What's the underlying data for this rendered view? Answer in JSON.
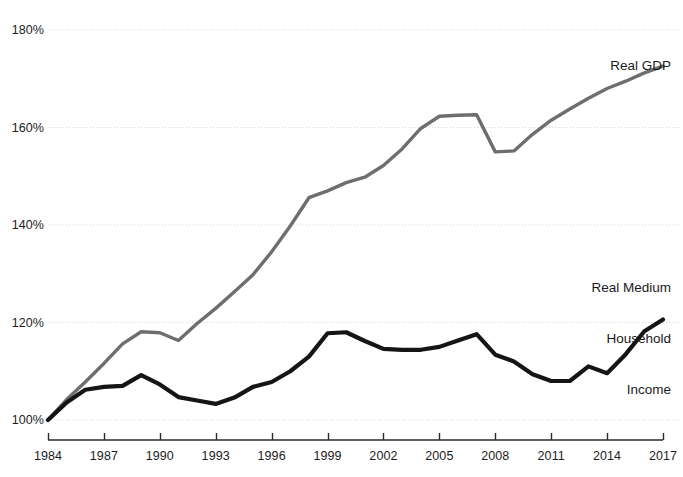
{
  "chart_data": {
    "type": "line",
    "title": "",
    "subtitle": "",
    "xlabel": "",
    "ylabel": "",
    "xlim": [
      1984,
      2017
    ],
    "ylim": [
      100,
      180
    ],
    "grid": true,
    "grid_axis": "y",
    "legend": "inline-annotations",
    "y_ticks": [
      "100%",
      "120%",
      "140%",
      "160%",
      "180%"
    ],
    "y_tick_values": [
      100,
      120,
      140,
      160,
      180
    ],
    "x_ticks": [
      "1984",
      "1987",
      "1990",
      "1993",
      "1996",
      "1999",
      "2002",
      "2005",
      "2008",
      "2011",
      "2014",
      "2017"
    ],
    "x_tick_values": [
      1984,
      1987,
      1990,
      1993,
      1996,
      1999,
      2002,
      2005,
      2008,
      2011,
      2014,
      2017
    ],
    "x": [
      1984,
      1985,
      1986,
      1987,
      1988,
      1989,
      1990,
      1991,
      1992,
      1993,
      1994,
      1995,
      1996,
      1997,
      1998,
      1999,
      2000,
      2001,
      2002,
      2003,
      2004,
      2005,
      2006,
      2007,
      2008,
      2009,
      2010,
      2011,
      2012,
      2013,
      2014,
      2015,
      2016,
      2017
    ],
    "series": [
      {
        "name": "Real GDP",
        "color": "#6e6e6e",
        "label_lines": [
          "Real GDP"
        ],
        "values": [
          100.0,
          104.2,
          107.8,
          111.6,
          115.6,
          118.1,
          117.9,
          116.3,
          119.8,
          122.9,
          126.3,
          129.8,
          134.5,
          139.8,
          145.6,
          147.0,
          148.7,
          149.8,
          152.2,
          155.6,
          159.8,
          162.3,
          162.5,
          162.6,
          155.0,
          155.2,
          158.6,
          161.5,
          163.8,
          166.0,
          168.0,
          169.5,
          171.2,
          172.6
        ]
      },
      {
        "name": "Real Medium Household Income",
        "color": "#151515",
        "label_lines": [
          "Real Medium",
          "Household",
          "Income"
        ],
        "values": [
          100.0,
          103.6,
          106.2,
          106.8,
          107.0,
          109.2,
          107.3,
          104.7,
          104.0,
          103.3,
          104.6,
          106.8,
          107.8,
          110.0,
          113.0,
          117.8,
          118.0,
          116.2,
          114.6,
          114.4,
          114.4,
          115.0,
          116.3,
          117.6,
          113.4,
          112.0,
          109.4,
          108.0,
          108.0,
          111.0,
          109.6,
          113.5,
          118.2,
          120.6
        ]
      }
    ]
  },
  "axis": {
    "y_tick_labels": [
      {
        "text": "180%",
        "value": 180
      },
      {
        "text": "160%",
        "value": 160
      },
      {
        "text": "140%",
        "value": 140
      },
      {
        "text": "120%",
        "value": 120
      },
      {
        "text": "100%",
        "value": 100
      }
    ],
    "x_tick_labels": [
      {
        "text": "1984",
        "value": 1984
      },
      {
        "text": "1987",
        "value": 1987
      },
      {
        "text": "1990",
        "value": 1990
      },
      {
        "text": "1993",
        "value": 1993
      },
      {
        "text": "1996",
        "value": 1996
      },
      {
        "text": "1999",
        "value": 1999
      },
      {
        "text": "2002",
        "value": 2002
      },
      {
        "text": "2005",
        "value": 2005
      },
      {
        "text": "2008",
        "value": 2008
      },
      {
        "text": "2011",
        "value": 2011
      },
      {
        "text": "2014",
        "value": 2014
      },
      {
        "text": "2017",
        "value": 2017
      }
    ]
  },
  "annotations": {
    "gdp_label": "Real GDP",
    "income_label_line1": "Real Medium",
    "income_label_line2": "Household",
    "income_label_line3": "Income"
  },
  "colors": {
    "gdp_line": "#6e6e6e",
    "income_line": "#151515",
    "gridline": "#d8d8d8",
    "axis": "#2a2a2a",
    "background": "#ffffff",
    "text": "#1c1c1c"
  }
}
